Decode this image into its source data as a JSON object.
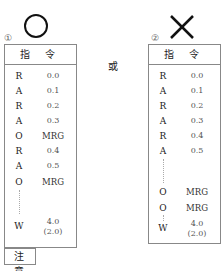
{
  "left": {
    "mark": "circle-correct",
    "number": "①",
    "header": "指 令",
    "rows": [
      {
        "ins": "R",
        "val": "0.0"
      },
      {
        "ins": "A",
        "val": "0.1"
      },
      {
        "ins": "R",
        "val": "0.2"
      },
      {
        "ins": "A",
        "val": "0.3"
      },
      {
        "ins": "O",
        "val": "MRG"
      },
      {
        "ins": "R",
        "val": "0.4"
      },
      {
        "ins": "A",
        "val": "0.5"
      },
      {
        "ins": "O",
        "val": "MRG"
      }
    ],
    "last": {
      "ins": "W",
      "val": "4.0",
      "val2": "(2.0)"
    }
  },
  "or_label": "或",
  "right": {
    "mark": "cross-wrong",
    "number": "②",
    "header": "指 令",
    "rows": [
      {
        "ins": "R",
        "val": "0.0"
      },
      {
        "ins": "A",
        "val": "0.1"
      },
      {
        "ins": "R",
        "val": "0.2"
      },
      {
        "ins": "A",
        "val": "0.3"
      },
      {
        "ins": "R",
        "val": "0.4"
      },
      {
        "ins": "A",
        "val": "0.5"
      }
    ],
    "rows2": [
      {
        "ins": "O",
        "val": "MRG"
      },
      {
        "ins": "O",
        "val": "MRG"
      }
    ],
    "last": {
      "ins": "W",
      "val": "4.0",
      "val2": "(2.0)"
    }
  },
  "note_label": "注 意"
}
